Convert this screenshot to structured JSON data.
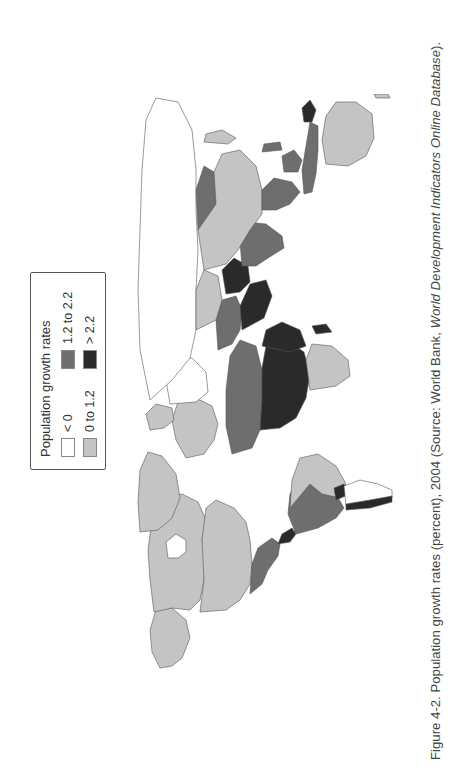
{
  "legend": {
    "title": "Population growth rates",
    "items": [
      {
        "label": "< 0",
        "color": "#ffffff"
      },
      {
        "label": "0 to 1.2",
        "color": "#c4c4c4"
      },
      {
        "label": "1.2 to 2.2",
        "color": "#6e6e6e"
      },
      {
        "label": "> 2.2",
        "color": "#2a2a2a"
      }
    ]
  },
  "caption": {
    "prefix": "Figure 4-2. Population growth rates (percent), 2004 (Source: World Bank, ",
    "source_italic": "World Development Indicators Online Database",
    "suffix": ")."
  },
  "map": {
    "orientation": "rotated 90° counter-clockwise (north toward left of page)",
    "regions": [
      {
        "name": "Russia",
        "class": "< 0"
      },
      {
        "name": "Eastern Europe",
        "class": "< 0"
      },
      {
        "name": "Western Europe",
        "class": "0 to 1.2"
      },
      {
        "name": "Greenland",
        "class": "0 to 1.2"
      },
      {
        "name": "Canada",
        "class": "0 to 1.2"
      },
      {
        "name": "Alaska / USA",
        "class": "0 to 1.2"
      },
      {
        "name": "United States",
        "class": "0 to 1.2"
      },
      {
        "name": "Mexico",
        "class": "1.2 to 2.2"
      },
      {
        "name": "Central America",
        "class": "> 2.2"
      },
      {
        "name": "Brazil",
        "class": "0 to 1.2"
      },
      {
        "name": "Andean South America",
        "class": "1.2 to 2.2"
      },
      {
        "name": "Argentina / Southern Cone",
        "class": "< 0"
      },
      {
        "name": "Bolivia / Paraguay",
        "class": "> 2.2"
      },
      {
        "name": "Chile coast",
        "class": "> 2.2"
      },
      {
        "name": "North Africa",
        "class": "1.2 to 2.2"
      },
      {
        "name": "Sahel / Central Africa",
        "class": "> 2.2"
      },
      {
        "name": "East Africa",
        "class": "> 2.2"
      },
      {
        "name": "Southern Africa",
        "class": "0 to 1.2"
      },
      {
        "name": "Arabian Peninsula",
        "class": "> 2.2"
      },
      {
        "name": "Middle East",
        "class": "1.2 to 2.2"
      },
      {
        "name": "Kazakhstan",
        "class": "0 to 1.2"
      },
      {
        "name": "Mongolia",
        "class": "1.2 to 2.2"
      },
      {
        "name": "China",
        "class": "0 to 1.2"
      },
      {
        "name": "Afghanistan / Pakistan",
        "class": "> 2.2"
      },
      {
        "name": "India",
        "class": "1.2 to 2.2"
      },
      {
        "name": "Southeast Asia",
        "class": "1.2 to 2.2"
      },
      {
        "name": "Indonesia",
        "class": "1.2 to 2.2"
      },
      {
        "name": "Papua New Guinea",
        "class": "> 2.2"
      },
      {
        "name": "Japan",
        "class": "0 to 1.2"
      },
      {
        "name": "Australia",
        "class": "0 to 1.2"
      },
      {
        "name": "Madagascar",
        "class": "> 2.2"
      }
    ]
  }
}
